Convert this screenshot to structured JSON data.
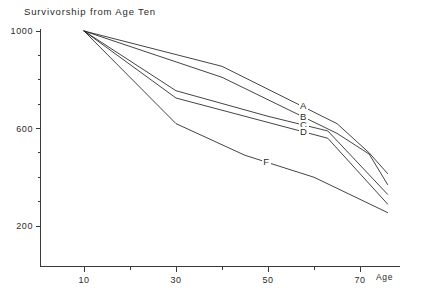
{
  "chart_data": {
    "type": "line",
    "title": "Survivorship from Age Ten",
    "xlabel": "Age",
    "ylabel": "",
    "xlim": [
      5,
      78
    ],
    "ylim": [
      110,
      1030
    ],
    "grid": false,
    "legend_position": "inline-right-of-curves",
    "x_ticks": [
      10,
      20,
      30,
      40,
      50,
      60,
      70
    ],
    "x_tick_labels": [
      "10",
      "",
      "30",
      "",
      "50",
      "",
      "70"
    ],
    "y_ticks": [
      200,
      300,
      400,
      500,
      600,
      700,
      800,
      900,
      1000
    ],
    "y_tick_labels": [
      "200",
      "",
      "",
      "",
      "600",
      "",
      "",
      "",
      "1000"
    ],
    "series": [
      {
        "name": "A",
        "x": [
          10,
          40,
          65,
          72,
          76
        ],
        "values": [
          1000,
          855,
          620,
          500,
          415
        ]
      },
      {
        "name": "B",
        "x": [
          10,
          40,
          65,
          72,
          76
        ],
        "values": [
          1000,
          810,
          580,
          495,
          370
        ]
      },
      {
        "name": "C",
        "x": [
          10,
          30,
          50,
          63,
          76
        ],
        "values": [
          1000,
          755,
          650,
          590,
          330
        ]
      },
      {
        "name": "D",
        "x": [
          10,
          30,
          50,
          63,
          76
        ],
        "values": [
          1000,
          725,
          625,
          560,
          290
        ]
      },
      {
        "name": "F",
        "x": [
          10,
          30,
          45,
          60,
          76
        ],
        "values": [
          1000,
          620,
          490,
          400,
          255
        ]
      }
    ],
    "annotations": [
      {
        "text": "A",
        "series": "A"
      },
      {
        "text": "B",
        "series": "B"
      },
      {
        "text": "C",
        "series": "C"
      },
      {
        "text": "D",
        "series": "D"
      },
      {
        "text": "F",
        "series": "F"
      }
    ]
  },
  "axes": {
    "x_axis_name": "Age",
    "y_axis_name": ""
  }
}
